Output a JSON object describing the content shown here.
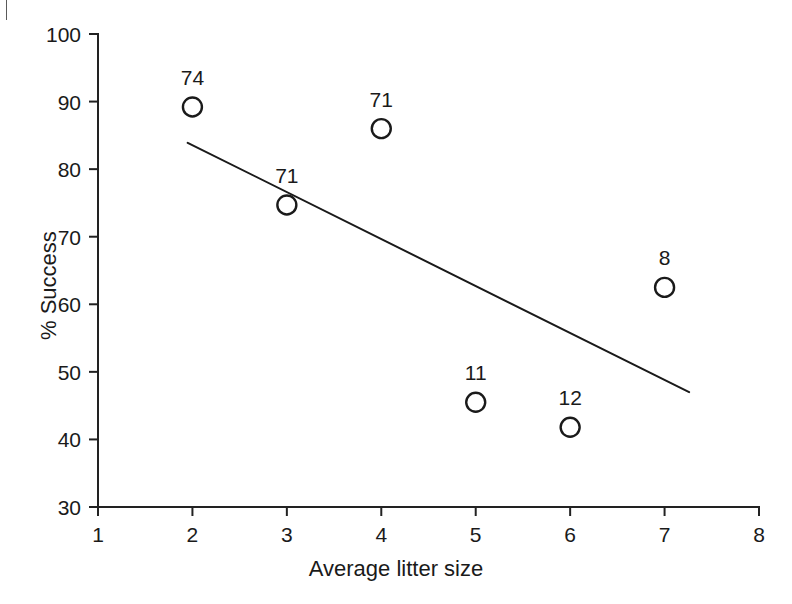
{
  "chart_data": {
    "type": "scatter",
    "title": "",
    "xlabel": "Average litter size",
    "ylabel": "% Success",
    "xlim": [
      1,
      8
    ],
    "ylim": [
      30,
      100
    ],
    "x_ticks": [
      1,
      2,
      3,
      4,
      5,
      6,
      7,
      8
    ],
    "x_tick_labels": [
      "1",
      "2",
      "3",
      "4",
      "5",
      "6",
      "7",
      "8"
    ],
    "y_ticks": [
      30,
      40,
      50,
      60,
      70,
      80,
      90,
      100
    ],
    "y_tick_labels": [
      "30",
      "40",
      "50",
      "60",
      "70",
      "80",
      "90",
      "100"
    ],
    "grid": false,
    "legend": "none",
    "marker": "open-circle",
    "points": [
      {
        "x": 2,
        "y": 89.2,
        "label": "74"
      },
      {
        "x": 3,
        "y": 74.7,
        "label": "71"
      },
      {
        "x": 4,
        "y": 86.0,
        "label": "71"
      },
      {
        "x": 5,
        "y": 45.5,
        "label": "11"
      },
      {
        "x": 6,
        "y": 41.8,
        "label": "12"
      },
      {
        "x": 7,
        "y": 62.5,
        "label": "8"
      }
    ],
    "annotations_note": "Number above each marker is the sample size (n) for that litter size",
    "trend_line": {
      "type": "linear-fit",
      "x_start": 1.95,
      "y_start": 83.9,
      "x_end": 7.26,
      "y_end": 47.0
    }
  },
  "figure": {
    "crop_mark": "page-crop-mark"
  }
}
